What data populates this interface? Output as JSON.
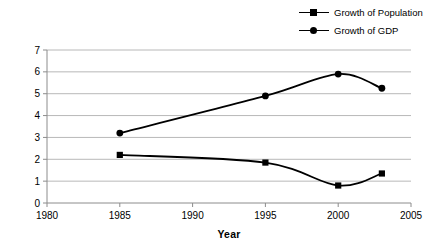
{
  "chart_data": {
    "type": "line",
    "title": "",
    "xlabel": "Year",
    "ylabel": "Growth (%)",
    "xlim": [
      1980,
      2005
    ],
    "ylim": [
      0,
      7
    ],
    "xticks": [
      1980,
      1985,
      1990,
      1995,
      2000,
      2005
    ],
    "yticks": [
      0,
      1,
      2,
      3,
      4,
      5,
      6,
      7
    ],
    "grid": "horizontal",
    "legend_position": "top-right",
    "x": [
      1985,
      1995,
      2000,
      2003
    ],
    "series": [
      {
        "name": "Growth of Population",
        "marker": "square",
        "color": "#000000",
        "values": [
          2.2,
          1.85,
          0.8,
          1.35
        ]
      },
      {
        "name": "Growth of GDP",
        "marker": "circle",
        "color": "#000000",
        "values": [
          3.2,
          4.9,
          5.9,
          5.25
        ]
      }
    ]
  },
  "legend": {
    "entries": [
      {
        "label": "Growth of Population",
        "marker": "square-marker-icon"
      },
      {
        "label": "Growth of GDP",
        "marker": "circle-marker-icon"
      }
    ]
  },
  "axes": {
    "y_title": "Growth (%)",
    "x_title": "Year",
    "y_tick_labels": [
      "0",
      "1",
      "2",
      "3",
      "4",
      "5",
      "6",
      "7"
    ],
    "x_tick_labels": [
      "1980",
      "1985",
      "1990",
      "1995",
      "2000",
      "2005"
    ]
  },
  "colors": {
    "line": "#000000",
    "gridline": "#b8b8b8",
    "axis": "#8c8c8c",
    "background": "#ffffff"
  }
}
